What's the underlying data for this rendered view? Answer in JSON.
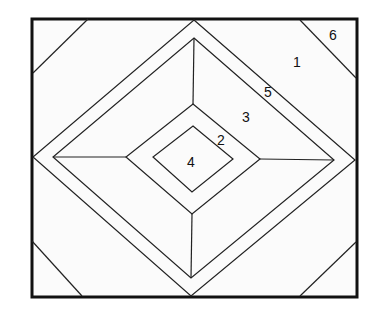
{
  "diagram": {
    "type": "nested-diamond-quilt-block",
    "frame": {
      "x1": 32,
      "y1": 19,
      "x2": 357,
      "y2": 297
    },
    "colors": {
      "stroke": "#222222",
      "frame_stroke": "#111111",
      "fill": "#fbfbfb"
    },
    "regions": [
      {
        "id": "1",
        "label": "1",
        "x": 297,
        "y": 67
      },
      {
        "id": "2",
        "label": "2",
        "x": 221,
        "y": 145
      },
      {
        "id": "3",
        "label": "3",
        "x": 246,
        "y": 122
      },
      {
        "id": "4",
        "label": "4",
        "x": 191,
        "y": 167
      },
      {
        "id": "5",
        "label": "5",
        "x": 268,
        "y": 97
      },
      {
        "id": "6",
        "label": "6",
        "x": 333,
        "y": 40
      }
    ],
    "outer_diamond": {
      "top": [
        194,
        20
      ],
      "right": [
        355,
        160
      ],
      "bottom": [
        191,
        296
      ],
      "left": [
        33,
        157
      ]
    },
    "band_diamond": {
      "top": [
        194,
        38
      ],
      "right": [
        334,
        160
      ],
      "bottom": [
        191,
        278
      ],
      "left": [
        53,
        157
      ]
    },
    "middle_diamond": {
      "top": [
        193,
        104
      ],
      "right": [
        260,
        159
      ],
      "bottom": [
        192,
        214
      ],
      "left": [
        126,
        157
      ]
    },
    "inner_diamond": {
      "top": [
        193,
        126
      ],
      "right": [
        233,
        159
      ],
      "bottom": [
        192,
        192
      ],
      "left": [
        153,
        157
      ]
    },
    "corner_lines": [
      {
        "name": "top-left",
        "from": [
          88,
          19
        ],
        "to": [
          33,
          73
        ]
      },
      {
        "name": "top-right",
        "from": [
          300,
          20
        ],
        "to": [
          356,
          78
        ]
      },
      {
        "name": "bottom-left",
        "from": [
          32,
          241
        ],
        "to": [
          82,
          296
        ]
      },
      {
        "name": "bottom-right",
        "from": [
          300,
          296
        ],
        "to": [
          356,
          242
        ]
      }
    ]
  }
}
